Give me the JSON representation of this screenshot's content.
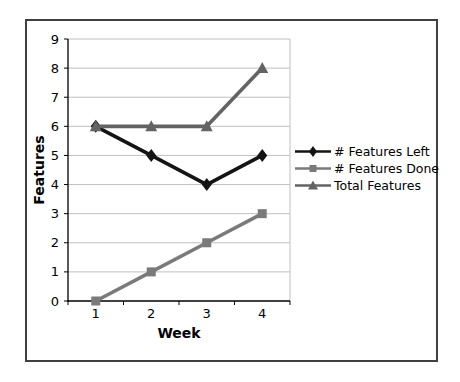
{
  "chart_data": {
    "type": "line",
    "x": [
      "1",
      "2",
      "3",
      "4"
    ],
    "xlabel": "Week",
    "ylabel": "Features",
    "ylim": [
      0,
      9
    ],
    "ytick_step": 1,
    "grid": true,
    "legend_position": "right",
    "series": [
      {
        "name": "# Features Left",
        "marker": "diamond",
        "color": "#141414",
        "values": [
          6,
          5,
          4,
          5
        ]
      },
      {
        "name": "# Features Done",
        "marker": "square",
        "color": "#7a7a7a",
        "values": [
          0,
          1,
          2,
          3
        ]
      },
      {
        "name": "Total Features",
        "marker": "triangle",
        "color": "#636363",
        "values": [
          6,
          6,
          6,
          8
        ]
      }
    ],
    "colors": {
      "background": "#ffffff",
      "frame_border": "#404040",
      "gridline": "#c0c0c0",
      "axis": "#000000",
      "text": "#000000"
    }
  }
}
